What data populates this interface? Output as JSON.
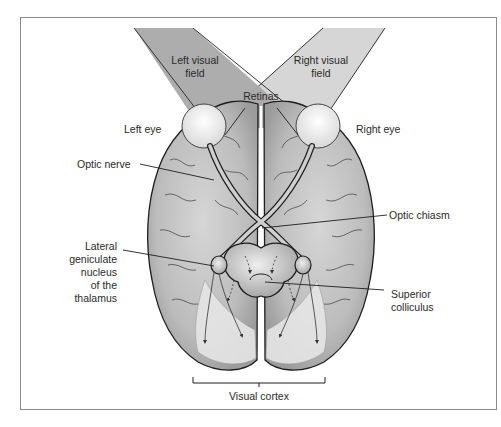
{
  "diagram": {
    "type": "anatomical",
    "colors": {
      "left_field": "#a9a9a9",
      "right_field": "#d4d4d4",
      "brain_fill": "#bdbdbd",
      "cortex_highlight": "#e6e6e6",
      "outline": "#1e1e1e",
      "frame": "#8a8a8a"
    },
    "labels": {
      "left_visual_field": [
        "Left visual",
        "field"
      ],
      "right_visual_field": [
        "Right visual",
        "field"
      ],
      "retinas": "Retinas",
      "left_eye": "Left eye",
      "right_eye": "Right eye",
      "optic_nerve": "Optic nerve",
      "optic_chiasm": "Optic chiasm",
      "lgn": [
        "Lateral",
        "geniculate",
        "nucleus",
        "of the",
        "thalamus"
      ],
      "superior_colliculus": [
        "Superior",
        "colliculus"
      ],
      "visual_cortex": "Visual cortex"
    }
  }
}
